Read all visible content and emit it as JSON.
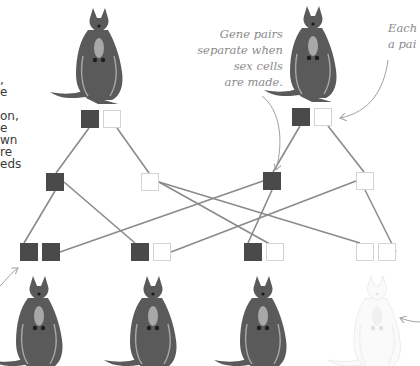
{
  "side_text_fragments": [
    ",",
    "e",
    "",
    "on,",
    "e",
    "wn",
    "re",
    "eds"
  ],
  "annotations": {
    "gene_pairs": [
      "Gene pairs",
      "separate when",
      "sex cells",
      "are made."
    ],
    "each": [
      "Each",
      "a pai"
    ]
  },
  "colors": {
    "dark_allele": "#4a4a4a",
    "light_allele": "#ffffff",
    "light_border": "#d4d4d4",
    "line": "#8a8a8a",
    "kangaroo_body": "#5a5a5a",
    "kangaroo_light": "#a8a8a8",
    "albino_outline": "#e8e8e8",
    "arrow": "#a0a0a0"
  },
  "parents": [
    {
      "name": "parent-1",
      "alleles": [
        "dark",
        "light"
      ],
      "phenotype": "dark"
    },
    {
      "name": "parent-2",
      "alleles": [
        "dark",
        "light"
      ],
      "phenotype": "dark"
    }
  ],
  "gametes": [
    {
      "from": "parent-1",
      "allele": "dark"
    },
    {
      "from": "parent-1",
      "allele": "light"
    },
    {
      "from": "parent-2",
      "allele": "dark"
    },
    {
      "from": "parent-2",
      "allele": "light"
    }
  ],
  "offspring": [
    {
      "alleles": [
        "dark",
        "dark"
      ],
      "phenotype": "dark"
    },
    {
      "alleles": [
        "dark",
        "light"
      ],
      "phenotype": "dark"
    },
    {
      "alleles": [
        "dark",
        "light"
      ],
      "phenotype": "dark"
    },
    {
      "alleles": [
        "light",
        "light"
      ],
      "phenotype": "albino"
    }
  ]
}
